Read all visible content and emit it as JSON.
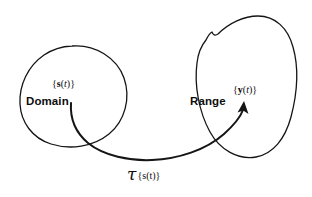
{
  "figure": {
    "type": "set-mapping-diagram",
    "background_color": "#ffffff",
    "ink_color": "#151515"
  },
  "domain": {
    "name": "Domain",
    "set_open": "{",
    "set_symbol": "s",
    "set_arg_open": "(",
    "set_arg": "t",
    "set_arg_close": ")",
    "set_close": "}"
  },
  "range": {
    "name": "Range",
    "set_open": "{",
    "set_symbol": "y",
    "set_arg_open": "(",
    "set_arg": "t",
    "set_arg_close": ")",
    "set_close": "}"
  },
  "operator": {
    "symbol": "τ",
    "set_open": "{",
    "set_symbol": "s",
    "set_arg_open": "(",
    "set_arg": "t",
    "set_arg_close": ")",
    "set_close": "}"
  }
}
